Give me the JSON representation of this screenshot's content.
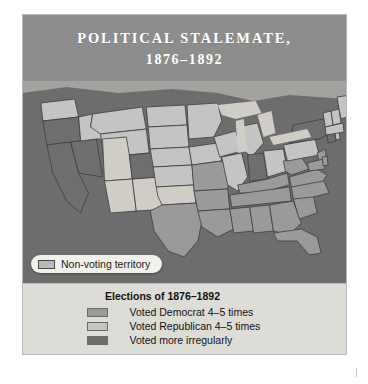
{
  "figure": {
    "title_line1": "POLITICAL STALEMATE,",
    "title_line2": "1876–1892",
    "title_band_color": "#8d8d8d",
    "map_background_color": "#6d6d6d"
  },
  "pill_legend": {
    "label": "Non-voting territory",
    "swatch_color": "#b9b9b9"
  },
  "key": {
    "title": "Elections of 1876–1892",
    "items": [
      {
        "label": "Voted Democrat 4–5 times",
        "color": "#9a9a9a"
      },
      {
        "label": "Voted Republican 4–5 times",
        "color": "#c4c4c4"
      },
      {
        "label": "Voted more irregularly",
        "color": "#6e6e6e"
      }
    ]
  },
  "map_data": {
    "type": "choropleth",
    "region": "United States",
    "categories": [
      "Voted Democrat 4–5 times",
      "Voted Republican 4–5 times",
      "Voted more irregularly",
      "Non-voting territory"
    ],
    "category_colors": [
      "#9a9a9a",
      "#c4c4c4",
      "#6e6e6e",
      "#cfcdc6"
    ],
    "water_color": "#cfcdc6",
    "border_color": "#3d3d3d",
    "states": [
      {
        "name": "Washington",
        "category": "Voted Republican 4–5 times"
      },
      {
        "name": "Oregon",
        "category": "Voted more irregularly"
      },
      {
        "name": "California",
        "category": "Voted more irregularly"
      },
      {
        "name": "Nevada",
        "category": "Voted more irregularly"
      },
      {
        "name": "Idaho",
        "category": "Voted Republican 4–5 times"
      },
      {
        "name": "Montana",
        "category": "Voted Republican 4–5 times"
      },
      {
        "name": "Wyoming",
        "category": "Voted Republican 4–5 times"
      },
      {
        "name": "Utah",
        "category": "Non-voting territory"
      },
      {
        "name": "Arizona",
        "category": "Non-voting territory"
      },
      {
        "name": "New Mexico",
        "category": "Non-voting territory"
      },
      {
        "name": "Colorado",
        "category": "Voted more irregularly"
      },
      {
        "name": "North Dakota",
        "category": "Voted Republican 4–5 times"
      },
      {
        "name": "South Dakota",
        "category": "Voted Republican 4–5 times"
      },
      {
        "name": "Nebraska",
        "category": "Voted Republican 4–5 times"
      },
      {
        "name": "Kansas",
        "category": "Voted Republican 4–5 times"
      },
      {
        "name": "Oklahoma",
        "category": "Non-voting territory"
      },
      {
        "name": "Texas",
        "category": "Voted Democrat 4–5 times"
      },
      {
        "name": "Minnesota",
        "category": "Voted Republican 4–5 times"
      },
      {
        "name": "Iowa",
        "category": "Voted Republican 4–5 times"
      },
      {
        "name": "Missouri",
        "category": "Voted Democrat 4–5 times"
      },
      {
        "name": "Arkansas",
        "category": "Voted Democrat 4–5 times"
      },
      {
        "name": "Louisiana",
        "category": "Voted Democrat 4–5 times"
      },
      {
        "name": "Wisconsin",
        "category": "Voted Republican 4–5 times"
      },
      {
        "name": "Illinois",
        "category": "Voted Republican 4–5 times"
      },
      {
        "name": "Michigan",
        "category": "Voted Republican 4–5 times"
      },
      {
        "name": "Indiana",
        "category": "Voted more irregularly"
      },
      {
        "name": "Ohio",
        "category": "Voted Republican 4–5 times"
      },
      {
        "name": "Kentucky",
        "category": "Voted Democrat 4–5 times"
      },
      {
        "name": "Tennessee",
        "category": "Voted Democrat 4–5 times"
      },
      {
        "name": "Mississippi",
        "category": "Voted Democrat 4–5 times"
      },
      {
        "name": "Alabama",
        "category": "Voted Democrat 4–5 times"
      },
      {
        "name": "Georgia",
        "category": "Voted Democrat 4–5 times"
      },
      {
        "name": "Florida",
        "category": "Voted Democrat 4–5 times"
      },
      {
        "name": "South Carolina",
        "category": "Voted Democrat 4–5 times"
      },
      {
        "name": "North Carolina",
        "category": "Voted Democrat 4–5 times"
      },
      {
        "name": "Virginia",
        "category": "Voted Democrat 4–5 times"
      },
      {
        "name": "West Virginia",
        "category": "Voted Democrat 4–5 times"
      },
      {
        "name": "Pennsylvania",
        "category": "Voted Republican 4–5 times"
      },
      {
        "name": "New York",
        "category": "Voted more irregularly"
      },
      {
        "name": "New Jersey",
        "category": "Voted Democrat 4–5 times"
      },
      {
        "name": "Maryland",
        "category": "Voted Democrat 4–5 times"
      },
      {
        "name": "Delaware",
        "category": "Voted Democrat 4–5 times"
      },
      {
        "name": "Connecticut",
        "category": "Voted more irregularly"
      },
      {
        "name": "Rhode Island",
        "category": "Voted Republican 4–5 times"
      },
      {
        "name": "Massachusetts",
        "category": "Voted Republican 4–5 times"
      },
      {
        "name": "Vermont",
        "category": "Voted Republican 4–5 times"
      },
      {
        "name": "New Hampshire",
        "category": "Voted Republican 4–5 times"
      },
      {
        "name": "Maine",
        "category": "Voted Republican 4–5 times"
      }
    ]
  }
}
